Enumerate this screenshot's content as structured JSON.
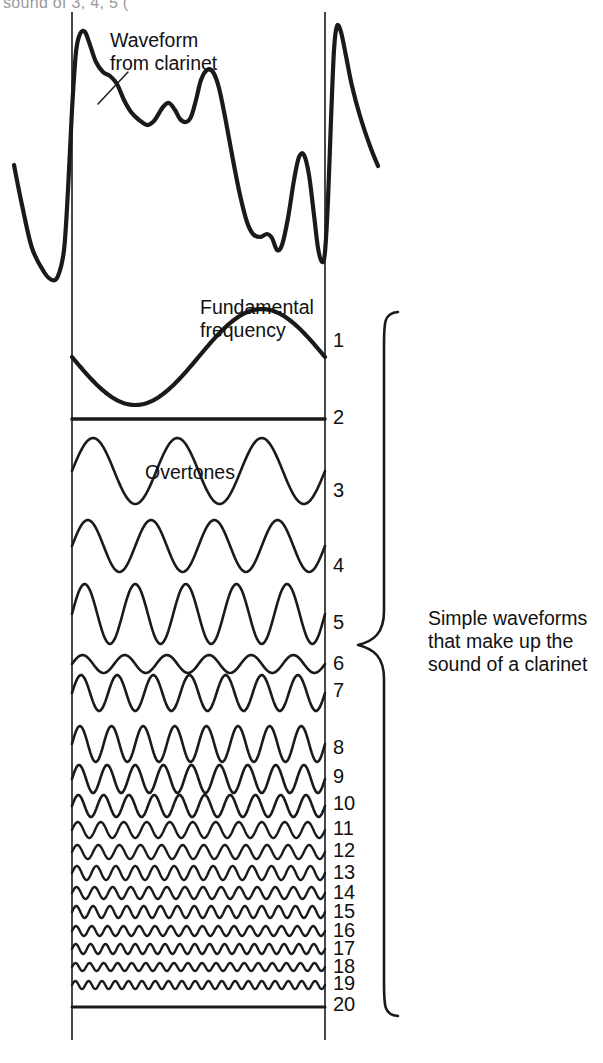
{
  "figure": {
    "background_color": "#ffffff",
    "ink_color": "#1a1a1a",
    "page_faint_text": "sound of 3, 4, 5 (",
    "annotations": {
      "waveform_from_clarinet": "Waveform\nfrom clarinet",
      "fundamental_frequency": "Fundamental\nfrequency",
      "overtones": "Overtones",
      "brace_caption": "Simple waveforms\nthat make up the\nsound of a clarinet"
    },
    "harmonic_numbers": [
      "1",
      "2",
      "3",
      "4",
      "5",
      "6",
      "7",
      "8",
      "9",
      "10",
      "11",
      "12",
      "13",
      "14",
      "15",
      "16",
      "17",
      "18",
      "19",
      "20"
    ]
  },
  "chart_data": {
    "type": "line",
    "title": "Simple waveforms that make up the sound of a clarinet",
    "xlabel": "",
    "ylabel": "",
    "grid": false,
    "legend": "none",
    "axis_lines": {
      "left_x": 72,
      "right_x": 325,
      "top_y": 12,
      "bottom_y": 1040
    },
    "composite_waveform": {
      "name": "Waveform from clarinet",
      "description": "Complex periodic pressure wave produced by a clarinet; two full periods shown",
      "stroke_width": 4.2,
      "points": [
        [
          14,
          165
        ],
        [
          22,
          205
        ],
        [
          32,
          248
        ],
        [
          44,
          272
        ],
        [
          52,
          280
        ],
        [
          58,
          276
        ],
        [
          64,
          250
        ],
        [
          68,
          190
        ],
        [
          72,
          110
        ],
        [
          76,
          52
        ],
        [
          80,
          34
        ],
        [
          85,
          32
        ],
        [
          90,
          45
        ],
        [
          96,
          62
        ],
        [
          103,
          72
        ],
        [
          110,
          76
        ],
        [
          117,
          84
        ],
        [
          124,
          100
        ],
        [
          131,
          112
        ],
        [
          139,
          120
        ],
        [
          147,
          125
        ],
        [
          153,
          122
        ],
        [
          158,
          115
        ],
        [
          163,
          107
        ],
        [
          169,
          103
        ],
        [
          175,
          110
        ],
        [
          180,
          119
        ],
        [
          186,
          122
        ],
        [
          191,
          117
        ],
        [
          196,
          100
        ],
        [
          201,
          80
        ],
        [
          207,
          70
        ],
        [
          213,
          72
        ],
        [
          219,
          88
        ],
        [
          226,
          122
        ],
        [
          233,
          160
        ],
        [
          240,
          195
        ],
        [
          247,
          222
        ],
        [
          253,
          234
        ],
        [
          260,
          237
        ],
        [
          267,
          234
        ],
        [
          272,
          238
        ],
        [
          277,
          250
        ],
        [
          282,
          245
        ],
        [
          288,
          218
        ],
        [
          294,
          180
        ],
        [
          299,
          157
        ],
        [
          304,
          155
        ],
        [
          309,
          175
        ],
        [
          314,
          215
        ],
        [
          318,
          248
        ],
        [
          322,
          262
        ],
        [
          325,
          252
        ],
        [
          328,
          200
        ],
        [
          331,
          120
        ],
        [
          334,
          50
        ],
        [
          337,
          26
        ],
        [
          341,
          32
        ],
        [
          346,
          56
        ],
        [
          352,
          86
        ],
        [
          360,
          116
        ],
        [
          370,
          146
        ],
        [
          378,
          166
        ]
      ]
    },
    "harmonic_rows": [
      {
        "n": 1,
        "label": "1",
        "label_y": 340,
        "baseline_y": 357,
        "cycles": 1,
        "amplitude": 48,
        "stroke_width": 4.2,
        "phase": 0.5,
        "note": "Fundamental frequency"
      },
      {
        "n": 2,
        "label": "2",
        "label_y": 417,
        "baseline_y": 419,
        "cycles": 2,
        "amplitude": 0,
        "stroke_width": 3.6,
        "phase": 0.5,
        "note": "Flat - second harmonic essentially absent"
      },
      {
        "n": 3,
        "label": "3",
        "label_y": 490,
        "baseline_y": 471,
        "cycles": 3,
        "amplitude": 33,
        "stroke_width": 2.6,
        "phase": 0.0
      },
      {
        "n": 4,
        "label": "4",
        "label_y": 565,
        "baseline_y": 546,
        "cycles": 4,
        "amplitude": 26,
        "stroke_width": 2.6,
        "phase": 0.0
      },
      {
        "n": 5,
        "label": "5",
        "label_y": 622,
        "baseline_y": 614,
        "cycles": 5,
        "amplitude": 30,
        "stroke_width": 2.6,
        "phase": 0.0
      },
      {
        "n": 6,
        "label": "6",
        "label_y": 663,
        "baseline_y": 664,
        "cycles": 6,
        "amplitude": 9,
        "stroke_width": 2.6,
        "phase": 0.0
      },
      {
        "n": 7,
        "label": "7",
        "label_y": 690,
        "baseline_y": 693,
        "cycles": 7,
        "amplitude": 18,
        "stroke_width": 2.6,
        "phase": 0.0
      },
      {
        "n": 8,
        "label": "8",
        "label_y": 747,
        "baseline_y": 744,
        "cycles": 8,
        "amplitude": 18,
        "stroke_width": 2.6,
        "phase": 0.0
      },
      {
        "n": 9,
        "label": "9",
        "label_y": 776,
        "baseline_y": 779,
        "cycles": 9,
        "amplitude": 14,
        "stroke_width": 2.6,
        "phase": 0.0
      },
      {
        "n": 10,
        "label": "10",
        "label_y": 803,
        "baseline_y": 806,
        "cycles": 10,
        "amplitude": 11,
        "stroke_width": 2.6,
        "phase": 0.0
      },
      {
        "n": 11,
        "label": "11",
        "label_y": 828,
        "baseline_y": 830,
        "cycles": 11,
        "amplitude": 8,
        "stroke_width": 2.4,
        "phase": 0.0
      },
      {
        "n": 12,
        "label": "12",
        "label_y": 850,
        "baseline_y": 852,
        "cycles": 12,
        "amplitude": 7,
        "stroke_width": 2.4,
        "phase": 0.0
      },
      {
        "n": 13,
        "label": "13",
        "label_y": 872,
        "baseline_y": 873,
        "cycles": 13,
        "amplitude": 7,
        "stroke_width": 2.4,
        "phase": 0.0
      },
      {
        "n": 14,
        "label": "14",
        "label_y": 892,
        "baseline_y": 893,
        "cycles": 14,
        "amplitude": 6,
        "stroke_width": 2.4,
        "phase": 0.0
      },
      {
        "n": 15,
        "label": "15",
        "label_y": 911,
        "baseline_y": 912,
        "cycles": 15,
        "amplitude": 6,
        "stroke_width": 2.4,
        "phase": 0.0
      },
      {
        "n": 16,
        "label": "16",
        "label_y": 930,
        "baseline_y": 931,
        "cycles": 16,
        "amplitude": 5,
        "stroke_width": 2.4,
        "phase": 0.0
      },
      {
        "n": 17,
        "label": "17",
        "label_y": 948,
        "baseline_y": 949,
        "cycles": 17,
        "amplitude": 5,
        "stroke_width": 2.4,
        "phase": 0.0
      },
      {
        "n": 18,
        "label": "18",
        "label_y": 966,
        "baseline_y": 967,
        "cycles": 18,
        "amplitude": 4,
        "stroke_width": 2.4,
        "phase": 0.0
      },
      {
        "n": 19,
        "label": "19",
        "label_y": 983,
        "baseline_y": 985,
        "cycles": 19,
        "amplitude": 4,
        "stroke_width": 2.4,
        "phase": 0.0
      },
      {
        "n": 20,
        "label": "20",
        "label_y": 1004,
        "baseline_y": 1007,
        "cycles": 20,
        "amplitude": 1,
        "stroke_width": 3.0,
        "phase": 0.0
      }
    ],
    "brace": {
      "top_y": 312,
      "bottom_y": 1016,
      "mid_y": 645,
      "left_x": 358,
      "tip_x": 398,
      "spine_x": 384
    },
    "leader_lines": [
      {
        "name": "waveform-leader",
        "from": [
          128,
          72
        ],
        "to": [
          98,
          104
        ]
      },
      {
        "name": "fundamental-leader",
        "from": [
          215,
          337
        ],
        "to": [
          180,
          378
        ]
      }
    ]
  }
}
